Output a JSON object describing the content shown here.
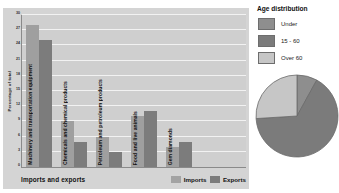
{
  "bar_panel": {
    "xaxis_title": "Imports and exports",
    "yaxis_title": "Percentage of total",
    "legend": [
      {
        "label": "Imports",
        "color": "#a3a3a3",
        "icon": "legend-swatch-icon"
      },
      {
        "label": "Exports",
        "color": "#7c7c7c",
        "icon": "legend-swatch-icon"
      }
    ]
  },
  "pie_panel": {
    "title": "Age distribution",
    "legend": [
      {
        "label": "Under",
        "color": "#8e8e8e"
      },
      {
        "label": "15 - 60",
        "color": "#7b7b7b"
      },
      {
        "label": "Over 60",
        "color": "#c6c6c6"
      }
    ]
  },
  "chart_data": [
    {
      "type": "bar",
      "title": "",
      "xlabel": "Imports and exports",
      "ylabel": "Percentage of total",
      "ylim": [
        0,
        30
      ],
      "yticks": [
        0,
        3,
        6,
        9,
        12,
        15,
        18,
        21,
        24,
        27,
        30
      ],
      "grid": true,
      "legend_position": "bottom-right",
      "categories": [
        "Machinery and transportation equipment",
        "Chemicals and chemical products",
        "Petroleum and petroleum products",
        "Food and live animals",
        "Gem diamonds"
      ],
      "series": [
        {
          "name": "Imports",
          "color": "#9f9f9f",
          "values": [
            28,
            9,
            6,
            10,
            4
          ]
        },
        {
          "name": "Exports",
          "color": "#7c7c7c",
          "values": [
            25,
            5,
            3,
            11,
            5
          ]
        }
      ]
    },
    {
      "type": "pie",
      "title": "Age distribution",
      "labels": [
        "Under",
        "15 - 60",
        "Over 60"
      ],
      "values": [
        8,
        66,
        26
      ],
      "colors": [
        "#8e8e8e",
        "#7b7b7b",
        "#c6c6c6"
      ],
      "legend_position": "top"
    }
  ]
}
